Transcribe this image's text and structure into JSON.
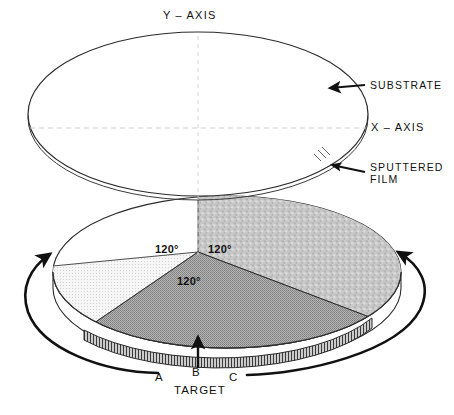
{
  "figure": {
    "type": "technical-diagram"
  },
  "axes": {
    "y_label": "Y – AXIS",
    "x_label": "X – AXIS"
  },
  "callouts": {
    "substrate": "SUBSTRATE",
    "sputtered_film_line1": "SPUTTERED",
    "sputtered_film_line2": "FILM"
  },
  "target": {
    "caption": "TARGET",
    "segments": [
      {
        "id": "A",
        "label": "A",
        "angle": "120°",
        "fill": "#f2f2f2"
      },
      {
        "id": "B",
        "label": "B",
        "angle": "120°",
        "fill": "#a8a8a8"
      },
      {
        "id": "C",
        "label": "C",
        "angle": "120°",
        "fill": "#c6c6c6"
      }
    ]
  },
  "colors": {
    "stroke": "#1a1a1a",
    "axis_guide": "#cfcfcf",
    "substrate_face": "#ffffff",
    "segment_a": "#f2f2f2",
    "segment_b": "#a8a8a8",
    "segment_c": "#c6c6c6",
    "disc_side": "#ffffff"
  },
  "annotations": {
    "rotation_arrow_left": "rotation-arrow-left",
    "rotation_arrow_right": "rotation-arrow-right",
    "target_pointer": "target-pointer-arrow"
  }
}
